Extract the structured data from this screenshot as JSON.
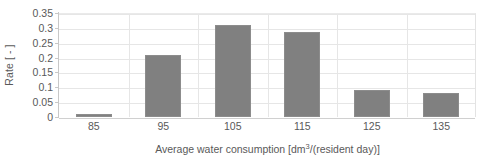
{
  "chart_data": {
    "type": "bar",
    "title": "",
    "categories": [
      "85",
      "95",
      "105",
      "115",
      "125",
      "135"
    ],
    "values": [
      0.01,
      0.21,
      0.31,
      0.285,
      0.09,
      0.08
    ],
    "series": [
      {
        "name": "Rate",
        "values": [
          0.01,
          0.21,
          0.31,
          0.285,
          0.09,
          0.08
        ]
      }
    ],
    "xlabel_parts": {
      "before": "Average water consumption [dm",
      "superscript": "3",
      "after": "/(resident day)]"
    },
    "xlabel": "Average water consumption [dm3/(resident day)]",
    "ylabel": "Rate [ - ]",
    "ylim": [
      0,
      0.35
    ],
    "yticks": [
      "0",
      "0.05",
      "0.1",
      "0.15",
      "0.2",
      "0.25",
      "0.3",
      "0.35"
    ],
    "ytick_values": [
      0,
      0.05,
      0.1,
      0.15,
      0.2,
      0.25,
      0.3,
      0.35
    ],
    "grid": "horizontal-and-vertical",
    "legend": "none",
    "bar_color": "#808080",
    "gridline_color": "#e6e6e6",
    "text_color": "#595959"
  }
}
